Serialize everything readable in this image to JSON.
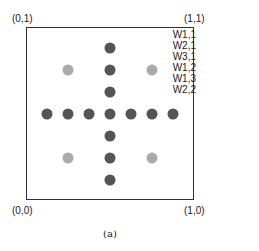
{
  "corners": {
    "top_left": "(0,1)",
    "top_right": "(1,1)",
    "bottom_left": "(0,0)",
    "bottom_right": "(1,0)"
  },
  "legend": [
    "W1,1",
    "W2,1",
    "W3,1",
    "W1,2",
    "W1,3",
    "W2,2"
  ],
  "caption": "(a)",
  "colors": {
    "dark_dot": "#555555",
    "light_dot": "#aaaaaa",
    "border": "#333333"
  },
  "dots": {
    "dark": [
      [
        110,
        48
      ],
      [
        110,
        70
      ],
      [
        110,
        92
      ],
      [
        47,
        114
      ],
      [
        68,
        114
      ],
      [
        89,
        114
      ],
      [
        110,
        114
      ],
      [
        131,
        114
      ],
      [
        152,
        114
      ],
      [
        173,
        114
      ],
      [
        110,
        136
      ],
      [
        110,
        158
      ],
      [
        110,
        180
      ]
    ],
    "light": [
      [
        68,
        70
      ],
      [
        152,
        70
      ],
      [
        68,
        158
      ],
      [
        152,
        158
      ]
    ]
  }
}
